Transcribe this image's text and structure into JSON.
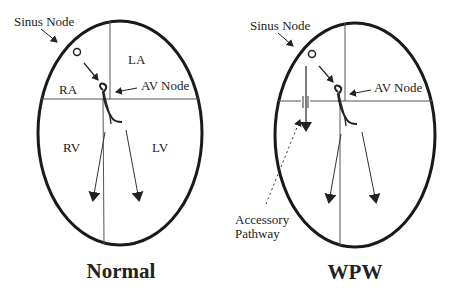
{
  "diagrams": [
    {
      "title": "Normal",
      "labels": {
        "sinus_node": "Sinus Node",
        "av_node": "AV Node",
        "ra": "RA",
        "la": "LA",
        "rv": "RV",
        "lv": "LV"
      }
    },
    {
      "title": "WPW",
      "labels": {
        "sinus_node": "Sinus Node",
        "av_node": "AV Node",
        "accessory_line1": "Accessory",
        "accessory_line2": "Pathway"
      }
    }
  ],
  "colors": {
    "outline": "#1a1a1a",
    "lines": "#444444",
    "text": "#222222"
  }
}
